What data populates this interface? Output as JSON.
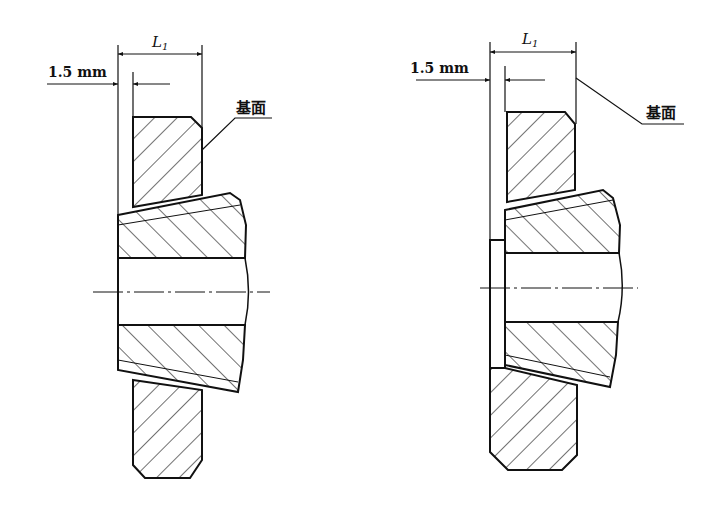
{
  "figures": [
    {
      "id": "left",
      "dimension_total": {
        "symbol": "L",
        "subscript": "1"
      },
      "dimension_offset": "1.5 mm",
      "datum_label": "基面",
      "variant": "flush"
    },
    {
      "id": "right",
      "dimension_total": {
        "symbol": "L",
        "subscript": "1"
      },
      "dimension_offset": "1.5 mm",
      "datum_label": "基面",
      "variant": "shim"
    }
  ],
  "colors": {
    "line": "#111111",
    "background": "#ffffff"
  }
}
